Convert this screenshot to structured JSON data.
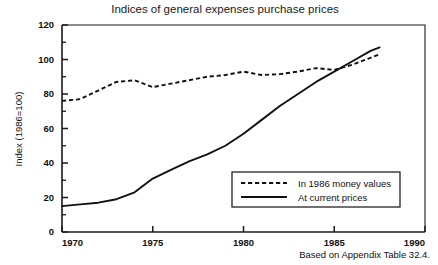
{
  "chart_data": {
    "type": "line",
    "title": "Indices of general expenses purchase prices",
    "xlabel": "",
    "ylabel": "Index (1986=100)",
    "xlim": [
      1970,
      1990
    ],
    "ylim": [
      0,
      120
    ],
    "xticks": [
      1970,
      1975,
      1980,
      1985,
      1990
    ],
    "xtick_labels": [
      "1970",
      "1975",
      "1980",
      "1985",
      "1990"
    ],
    "yticks": [
      0,
      20,
      40,
      60,
      80,
      100,
      120
    ],
    "ytick_labels": [
      "0",
      "20",
      "40",
      "60",
      "80",
      "100",
      "120"
    ],
    "yticks_minor": [
      10,
      30,
      50,
      70,
      90,
      110
    ],
    "grid": false,
    "legend_position": "lower right",
    "series": [
      {
        "name": "In 1986 money values",
        "style": "dashed",
        "color": "#111111",
        "x": [
          1970,
          1971,
          1972,
          1973,
          1974,
          1975,
          1976,
          1977,
          1978,
          1979,
          1980,
          1981,
          1982,
          1983,
          1984,
          1985,
          1986,
          1987,
          1987.5
        ],
        "values": [
          76,
          77,
          82,
          87,
          88,
          84,
          86,
          88,
          90,
          91,
          93,
          91,
          91.5,
          93,
          95,
          94,
          97,
          101,
          103
        ]
      },
      {
        "name": "At current prices",
        "style": "solid",
        "color": "#111111",
        "x": [
          1970,
          1971,
          1972,
          1973,
          1974,
          1975,
          1976,
          1977,
          1978,
          1979,
          1980,
          1981,
          1982,
          1983,
          1984,
          1985,
          1986,
          1987,
          1987.5
        ],
        "values": [
          15,
          16,
          17,
          19,
          23,
          31,
          36,
          41,
          45,
          50,
          57,
          65,
          73,
          80,
          87,
          93,
          99,
          105,
          107
        ]
      }
    ],
    "annotations": []
  },
  "legend": {
    "entries": [
      {
        "label": "In 1986 money values",
        "style": "dashed"
      },
      {
        "label": "At current prices",
        "style": "solid"
      }
    ]
  },
  "source_note": "Based on Appendix Table 32.4."
}
